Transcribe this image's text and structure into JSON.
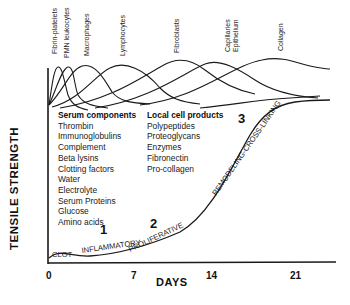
{
  "diagram": {
    "type": "wound-healing-timeline",
    "y_axis_label": "TENSILE STRENGTH",
    "x_axis_label": "DAYS",
    "x_ticks": [
      "0",
      "7",
      "14",
      "21"
    ],
    "cell_curves": [
      {
        "label": "Fibrin-platelets"
      },
      {
        "label": "PMN leukocytes"
      },
      {
        "label": "Macrophages"
      },
      {
        "label": "Lymphocytes"
      },
      {
        "label": "Fibroblasts"
      },
      {
        "label": "Capillaries Epithelium"
      },
      {
        "label": "Collagen"
      }
    ],
    "serum_components": {
      "heading": "Serum components",
      "items": [
        "Thrombin",
        "Immunoglobulins",
        "Complement",
        "Beta lysins",
        "Clotting factors",
        "Water",
        "Electrolyte",
        "Serum Proteins",
        "Glucose",
        "Amino acids"
      ]
    },
    "local_cell_products": {
      "heading": "Local cell products",
      "items": [
        "Polypeptides",
        "Proteoglycans",
        "Enzymes",
        "Fibronectin",
        "Pro-collagen"
      ]
    },
    "phases": [
      {
        "number": "1",
        "label": "INFLAMMATORY"
      },
      {
        "number": "2",
        "label": "PROLIFERATIVE"
      },
      {
        "number": "3",
        "label": "REMODELING-CROSS-LINKING"
      }
    ],
    "clot_label": "CLOT",
    "line_color": "#1a1a1a"
  }
}
